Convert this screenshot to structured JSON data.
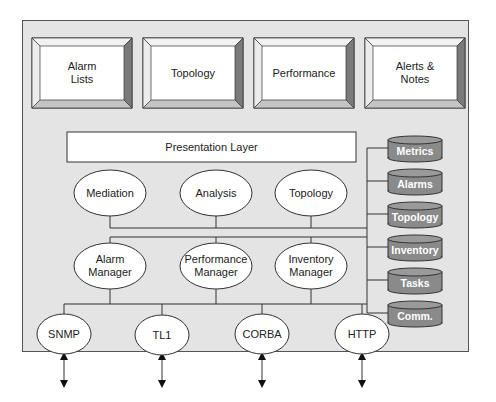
{
  "diagram": {
    "panels": [
      {
        "label": "Alarm\nLists"
      },
      {
        "label": "Topology"
      },
      {
        "label": "Performance"
      },
      {
        "label": "Alerts &\nNotes"
      }
    ],
    "presentation_layer": "Presentation Layer",
    "services_row": [
      {
        "label": "Mediation"
      },
      {
        "label": "Analysis"
      },
      {
        "label": "Topology"
      }
    ],
    "managers_row": [
      {
        "label": "Alarm\nManager"
      },
      {
        "label": "Performance\nManager"
      },
      {
        "label": "Inventory\nManager"
      }
    ],
    "protocols": [
      {
        "label": "SNMP"
      },
      {
        "label": "TL1"
      },
      {
        "label": "CORBA"
      },
      {
        "label": "HTTP"
      }
    ],
    "databases": [
      {
        "label": "Metrics"
      },
      {
        "label": "Alarms"
      },
      {
        "label": "Topology"
      },
      {
        "label": "Inventory"
      },
      {
        "label": "Tasks"
      },
      {
        "label": "Comm."
      }
    ],
    "colors": {
      "frame_bg": "#e4e4e4",
      "db_fill": "#8a8a8a",
      "bevel_dark": "#7a7a7a",
      "bevel_light": "#d2d2d2"
    }
  }
}
